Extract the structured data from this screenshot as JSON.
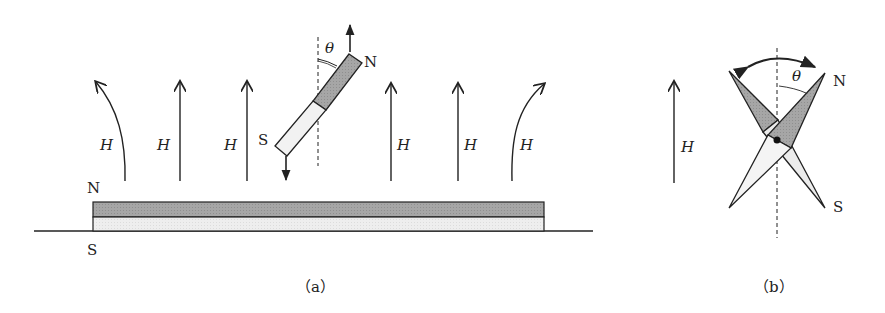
{
  "figure_a": {
    "caption": "（a）",
    "field_label": "H",
    "magnet_top_pole": "N",
    "magnet_bottom_pole": "S",
    "needle_north": "N",
    "needle_south": "S",
    "angle_label": "θ"
  },
  "figure_b": {
    "caption": "（b）",
    "field_label": "H",
    "needle_north": "N",
    "needle_south": "S",
    "angle_label": "θ"
  },
  "colors": {
    "stroke": "#222222",
    "north_fill": "#a8a8a8",
    "south_fill": "#ececec"
  }
}
